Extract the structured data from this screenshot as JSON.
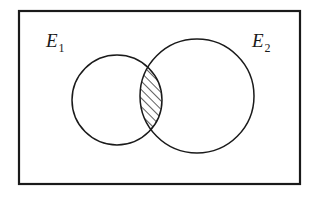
{
  "figure": {
    "name": "venn-diagram-two-overlapping-events",
    "background_color": "#ffffff",
    "ink_color": "#1a1a1a",
    "universe": {
      "shape": "rectangle",
      "label": "",
      "stroke_width": 2.2,
      "x": 19,
      "y": 11,
      "width": 281,
      "height": 173
    },
    "sets": [
      {
        "id": "E1",
        "label_base": "E",
        "label_subscript": "1",
        "label_x": 46,
        "label_y": 47,
        "circle": {
          "cx": 117,
          "cy": 100,
          "r": 45
        },
        "stroke_width": 1.5,
        "fill": "none"
      },
      {
        "id": "E2",
        "label_base": "E",
        "label_subscript": "2",
        "label_x": 252,
        "label_y": 47,
        "circle": {
          "cx": 197,
          "cy": 96,
          "r": 57
        },
        "stroke_width": 1.5,
        "fill": "none"
      }
    ],
    "intersection": {
      "name": "E1-intersect-E2",
      "fill_pattern": "diagonal-hatch",
      "hatch_angle_deg": 45,
      "hatch_spacing": 6,
      "hatch_stroke_width": 1.4,
      "upper_crossing": {
        "x": 148,
        "y": 62
      },
      "lower_crossing": {
        "x": 150,
        "y": 133
      }
    }
  }
}
